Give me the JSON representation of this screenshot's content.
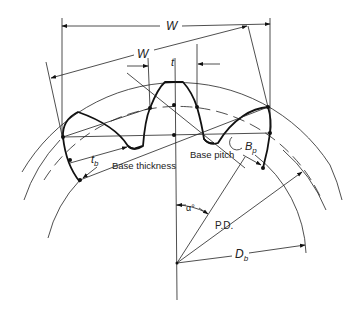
{
  "figure": {
    "colors": {
      "ink": "#111111",
      "background": "#ffffff"
    }
  },
  "labels": {
    "span_horizontal": "W",
    "span_normal": "W",
    "tooth_thickness": "t",
    "base_thickness_symbol": "t",
    "base_thickness_subscript": "b",
    "base_thickness_text": "Base thickness",
    "base_pitch_text": "Base pitch",
    "base_pitch_symbol": "B",
    "base_pitch_subscript": "p",
    "pressure_angle": "α°",
    "pitch_diameter": "P.D.",
    "base_diameter_symbol": "D",
    "base_diameter_subscript": "b"
  }
}
